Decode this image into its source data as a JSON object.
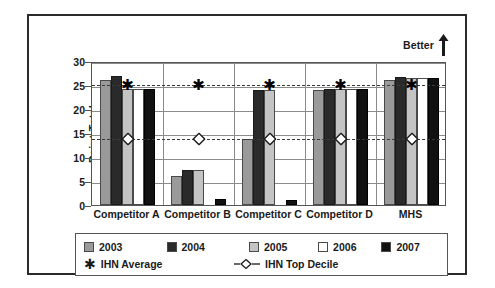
{
  "chart_data": {
    "type": "bar",
    "title": "",
    "xlabel": "",
    "ylabel": "Point Total",
    "ylim": [
      0,
      30
    ],
    "yticks": [
      0,
      5,
      10,
      15,
      20,
      25,
      30
    ],
    "grid": true,
    "legend_position": "bottom",
    "annotation": "Better",
    "categories": [
      "Competitor A",
      "Competitor B",
      "Competitor C",
      "Competitor D",
      "MHS"
    ],
    "series": [
      {
        "name": "2003",
        "color": "#9a9a9a",
        "values": [
          26.0,
          6.0,
          13.7,
          23.9,
          26.0
        ]
      },
      {
        "name": "2004",
        "color": "#2a2a2a",
        "values": [
          26.8,
          7.2,
          24.0,
          24.2,
          26.6
        ]
      },
      {
        "name": "2005",
        "color": "#c4c4c4",
        "values": [
          24.1,
          7.2,
          24.0,
          24.1,
          26.4
        ]
      },
      {
        "name": "2006",
        "color": "#ffffff",
        "values": [
          24.1,
          0.0,
          0.0,
          24.1,
          26.4
        ]
      },
      {
        "name": "2007",
        "color": "#111111",
        "values": [
          24.1,
          1.3,
          1.0,
          24.2,
          26.4
        ]
      }
    ],
    "reference_lines": [
      {
        "name": "IHN Average",
        "value": 25.5,
        "marker": "star",
        "style": "dashed"
      },
      {
        "name": "IHN Top Decile",
        "value": 14.2,
        "marker": "diamond",
        "style": "dashed"
      }
    ]
  },
  "axis": {
    "y_label": "Point Total",
    "y_ticks": [
      "30",
      "25",
      "20",
      "15",
      "10",
      "5",
      "0"
    ],
    "x_categories": [
      "Competitor A",
      "Competitor B",
      "Competitor C",
      "Competitor D",
      "MHS"
    ]
  },
  "annotation": {
    "better_label": "Better",
    "arrow_icon": "up-arrow-icon"
  },
  "legend": {
    "years": [
      {
        "label": "2003",
        "color": "#9a9a9a"
      },
      {
        "label": "2004",
        "color": "#2a2a2a"
      },
      {
        "label": "2005",
        "color": "#c4c4c4"
      },
      {
        "label": "2006",
        "color": "#ffffff"
      },
      {
        "label": "2007",
        "color": "#111111"
      }
    ],
    "ihn_average": "IHN Average",
    "ihn_top_decile": "IHN Top Decile",
    "star_glyph": "✱"
  },
  "colors": {
    "frame": "#2b2b2b",
    "grid": "#8a8a8a",
    "axis": "#555555",
    "text": "#1a1a1a",
    "reference": "#3a3a3a"
  }
}
